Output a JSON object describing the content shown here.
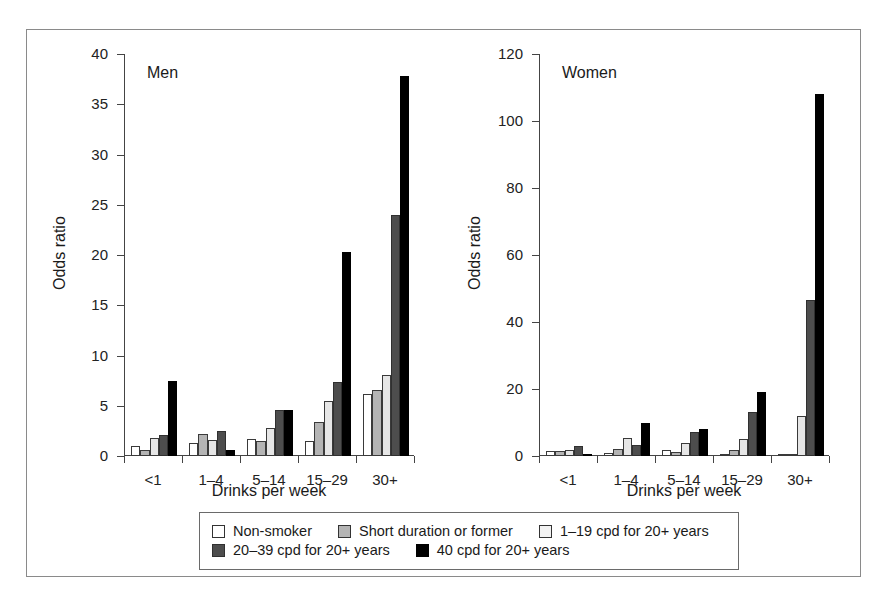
{
  "figure": {
    "ylabel": "Odds ratio",
    "xlabel": "Drinks per week"
  },
  "series_names": [
    "Non-smoker",
    "Short duration or former",
    "1–19 cpd for 20+ years",
    "20–39 cpd for 20+ years",
    "40 cpd for 20+ years"
  ],
  "series_colors": [
    "#ffffff",
    "#b4b4b4",
    "#e6e6e6",
    "#4d4d4d",
    "#000000"
  ],
  "legend": {
    "row1": [
      {
        "label": "Non-smoker",
        "swatch": "sw0"
      },
      {
        "label": "Short duration or former",
        "swatch": "sw1"
      },
      {
        "label": "1–19 cpd for 20+ years",
        "swatch": "sw2"
      }
    ],
    "row2": [
      {
        "label": "20–39 cpd for 20+ years",
        "swatch": "sw3"
      },
      {
        "label": "40 cpd for 20+ years",
        "swatch": "sw4"
      }
    ]
  },
  "chart_data": [
    {
      "type": "bar",
      "title": "Men",
      "xlabel": "Drinks per week",
      "ylabel": "Odds ratio",
      "ylim": [
        0,
        40
      ],
      "yticks": [
        0,
        5,
        10,
        15,
        20,
        25,
        30,
        35,
        40
      ],
      "ytick_labels": [
        "0",
        "5",
        "10",
        "15",
        "20",
        "25",
        "30",
        "35",
        "40"
      ],
      "grid": false,
      "legend_position": "bottom",
      "categories": [
        "<1",
        "1–4",
        "5–14",
        "15–29",
        "30+"
      ],
      "series": [
        {
          "name": "Non-smoker",
          "values": [
            1.0,
            1.3,
            1.7,
            1.5,
            6.2
          ]
        },
        {
          "name": "Short duration or former",
          "values": [
            0.6,
            2.2,
            1.5,
            3.4,
            6.6
          ]
        },
        {
          "name": "1–19 cpd for 20+ years",
          "values": [
            1.8,
            1.6,
            2.8,
            5.5,
            8.1
          ]
        },
        {
          "name": "20–39 cpd for 20+ years",
          "values": [
            2.1,
            2.5,
            4.6,
            7.4,
            24.0
          ]
        },
        {
          "name": "40 cpd for 20+ years",
          "values": [
            7.5,
            0.6,
            4.6,
            20.3,
            37.8
          ]
        }
      ]
    },
    {
      "type": "bar",
      "title": "Women",
      "xlabel": "Drinks per week",
      "ylabel": "Odds ratio",
      "ylim": [
        0,
        120
      ],
      "yticks": [
        0,
        20,
        40,
        60,
        80,
        100,
        120
      ],
      "ytick_labels": [
        "0",
        "20",
        "40",
        "60",
        "80",
        "100",
        "120"
      ],
      "grid": false,
      "legend_position": "bottom",
      "categories": [
        "<1",
        "1–4",
        "5–14",
        "15–29",
        "30+"
      ],
      "series": [
        {
          "name": "Non-smoker",
          "values": [
            1.6,
            1.0,
            1.9,
            0.4,
            0.3
          ]
        },
        {
          "name": "Short duration or former",
          "values": [
            1.4,
            2.0,
            1.1,
            1.8,
            0.3
          ]
        },
        {
          "name": "1–19 cpd for 20+ years",
          "values": [
            1.7,
            5.5,
            3.8,
            5.0,
            12.0
          ]
        },
        {
          "name": "20–39 cpd for 20+ years",
          "values": [
            2.9,
            3.2,
            7.2,
            13.0,
            46.5
          ]
        },
        {
          "name": "40 cpd for 20+ years",
          "values": [
            0.2,
            10.0,
            8.0,
            19.0,
            108.0
          ]
        }
      ]
    }
  ]
}
